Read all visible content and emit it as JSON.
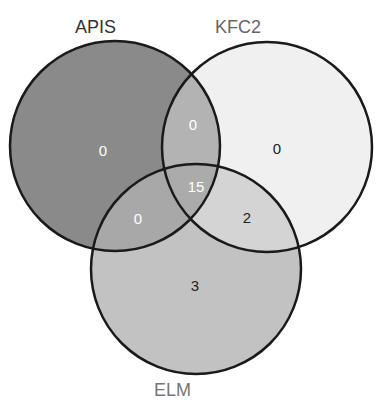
{
  "diagram": {
    "type": "venn-3",
    "sets": [
      {
        "id": "apis",
        "label": "APIS",
        "label_color": "#333333",
        "fill": "#8a8a8a"
      },
      {
        "id": "kfc2",
        "label": "KFC2",
        "label_color": "#666666",
        "fill": "#f0f0f0"
      },
      {
        "id": "elm",
        "label": "ELM",
        "label_color": "#777777",
        "fill": "#c2c2c2"
      }
    ],
    "regions": {
      "apis_only": {
        "count": "0",
        "fill": "#8a8a8a",
        "text_color": "#ffffff"
      },
      "kfc2_only": {
        "count": "0",
        "fill": "#f0f0f0",
        "text_color": "#222222"
      },
      "elm_only": {
        "count": "3",
        "fill": "#c2c2c2",
        "text_color": "#222222"
      },
      "apis_kfc2": {
        "count": "0",
        "fill": "#b3b3b3",
        "text_color": "#ffffff"
      },
      "apis_elm": {
        "count": "0",
        "fill": "#a8a8a8",
        "text_color": "#ffffff"
      },
      "kfc2_elm": {
        "count": "2",
        "fill": "#d4d4d4",
        "text_color": "#222222"
      },
      "all_three": {
        "count": "15",
        "fill": "#ababab",
        "text_color": "#ffffff"
      }
    },
    "stroke_color": "#1a1a1a"
  }
}
